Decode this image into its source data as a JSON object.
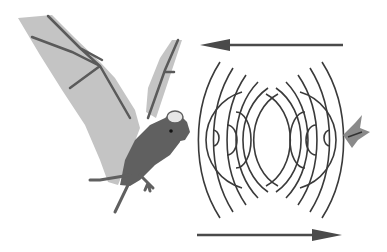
{
  "diagram": {
    "colors": {
      "background": "#ffffff",
      "wing": "#c4c4c4",
      "wing_bone": "#5a5a5a",
      "body": "#606060",
      "ear": "#e6e6e6",
      "wave": "#3a3a3a",
      "arrow": "#4a4a4a",
      "moth": "#8a8a8a"
    },
    "arrows": [
      {
        "name": "outgoing-arrow",
        "direction": "left",
        "x1": 343,
        "x2": 200,
        "y": 45
      },
      {
        "name": "return-arrow",
        "direction": "right",
        "x1": 197,
        "x2": 342,
        "y": 235
      }
    ],
    "labels": []
  }
}
